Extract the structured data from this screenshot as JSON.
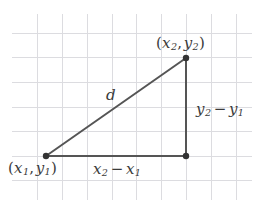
{
  "figure": {
    "type": "geometry-diagram",
    "width": 257,
    "height": 214,
    "background_color": "#ffffff"
  },
  "grid": {
    "line_color": "#dcdce0",
    "line_width": 1,
    "vertical_lines_x": [
      37,
      62,
      87,
      112,
      136,
      161,
      186,
      211,
      236
    ],
    "horizontal_lines_y": [
      33,
      57,
      82,
      107,
      131,
      156,
      180
    ],
    "vertical_extent": [
      14,
      200
    ],
    "horizontal_extent": [
      12,
      252
    ]
  },
  "triangle": {
    "stroke_color": "#555555",
    "stroke_width": 2,
    "vertex_color": "#333333",
    "vertex_radius": 3.2,
    "vertices": {
      "bottom_left": {
        "name": "point-p1",
        "x": 46,
        "y": 156
      },
      "bottom_right": {
        "name": "point-right-angle",
        "x": 186,
        "y": 156
      },
      "top_right": {
        "name": "point-p2",
        "x": 186,
        "y": 58
      }
    },
    "edges": [
      {
        "name": "hypotenuse",
        "from": "bottom_left",
        "to": "top_right"
      },
      {
        "name": "horizontal-leg",
        "from": "bottom_left",
        "to": "bottom_right"
      },
      {
        "name": "vertical-leg",
        "from": "bottom_right",
        "to": "top_right"
      }
    ]
  },
  "labels": {
    "point2": {
      "open_paren": "(",
      "x_var": "x",
      "x_sub": "2",
      "comma": ",",
      "y_var": "y",
      "y_sub": "2",
      "close_paren": ")",
      "plain": "(x2, y2)"
    },
    "point1": {
      "open_paren": "(",
      "x_var": "x",
      "x_sub": "1",
      "comma": ",",
      "y_var": "y",
      "y_sub": "1",
      "close_paren": ")",
      "plain": "(x1, y1)"
    },
    "delta_x": {
      "first_var": "x",
      "first_sub": "2",
      "operator": "−",
      "second_var": "x",
      "second_sub": "1",
      "plain": "x2 − x1"
    },
    "delta_y": {
      "first_var": "y",
      "first_sub": "2",
      "operator": "−",
      "second_var": "y",
      "second_sub": "1",
      "plain": "y2 − y1"
    },
    "distance": {
      "symbol": "d",
      "plain": "d"
    }
  }
}
